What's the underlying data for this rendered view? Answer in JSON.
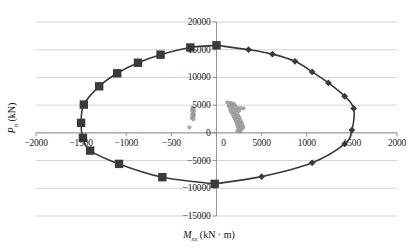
{
  "axes": {
    "x_title_main": "M",
    "x_title_sub": "xx",
    "x_title_units": " (kN · m)",
    "y_title_main": "P",
    "y_title_sub": "n",
    "y_title_units": " (kN)"
  },
  "chart_data": {
    "type": "scatter",
    "title": "",
    "xlabel": "M_xx (kN · m)",
    "ylabel": "P_n (kN)",
    "xlim": [
      -2000,
      2000
    ],
    "ylim": [
      -15000,
      20000
    ],
    "xticks": [
      -2000,
      -1500,
      -1000,
      -500,
      0,
      500,
      1000,
      1500,
      2000
    ],
    "xticklabels": [
      "−2000",
      "−1500",
      "−1000",
      "−500",
      "0",
      "5000",
      "1000",
      "1500",
      "2000"
    ],
    "yticks": [
      -15000,
      -10000,
      -5000,
      0,
      5000,
      10000,
      15000,
      20000
    ],
    "yticklabels": [
      "−15000",
      "−10000",
      "−5000",
      "0",
      "5000",
      "10000",
      "15000",
      "20000"
    ],
    "grid": "horizontal",
    "legend": "none",
    "series": [
      {
        "name": "interaction-curve-left",
        "marker": "square",
        "color": "#3a3a3a",
        "points": [
          [
            0,
            15800
          ],
          [
            -290,
            15400
          ],
          [
            -620,
            14100
          ],
          [
            -870,
            12650
          ],
          [
            -1100,
            10750
          ],
          [
            -1300,
            8400
          ],
          [
            -1470,
            5100
          ],
          [
            -1500,
            1800
          ],
          [
            -1480,
            -900
          ],
          [
            -1400,
            -3200
          ],
          [
            -1080,
            -5600
          ],
          [
            -600,
            -8000
          ],
          [
            -20,
            -9200
          ]
        ]
      },
      {
        "name": "interaction-curve-right",
        "marker": "diamond",
        "color": "#3a3a3a",
        "points": [
          [
            0,
            15800
          ],
          [
            355,
            15000
          ],
          [
            620,
            14200
          ],
          [
            870,
            12900
          ],
          [
            1060,
            11000
          ],
          [
            1240,
            9000
          ],
          [
            1420,
            6600
          ],
          [
            1520,
            4400
          ],
          [
            1500,
            500
          ],
          [
            1420,
            -2000
          ],
          [
            1060,
            -5400
          ],
          [
            500,
            -7900
          ],
          [
            -20,
            -9200
          ]
        ]
      },
      {
        "name": "demand-points",
        "marker": "circle",
        "color": "#9a9a9a",
        "points": [
          [
            -265,
            4550
          ],
          [
            -258,
            4300
          ],
          [
            -270,
            4100
          ],
          [
            -250,
            3950
          ],
          [
            -262,
            3750
          ],
          [
            -255,
            3500
          ],
          [
            -268,
            3300
          ],
          [
            -252,
            3100
          ],
          [
            -260,
            2900
          ],
          [
            -272,
            2700
          ],
          [
            -256,
            2450
          ],
          [
            -300,
            1000
          ],
          [
            120,
            5500
          ],
          [
            155,
            5400
          ],
          [
            185,
            5300
          ],
          [
            145,
            5200
          ],
          [
            175,
            5050
          ],
          [
            205,
            4950
          ],
          [
            135,
            4850
          ],
          [
            165,
            4700
          ],
          [
            195,
            4600
          ],
          [
            230,
            4500
          ],
          [
            265,
            4450
          ],
          [
            300,
            4400
          ],
          [
            150,
            4300
          ],
          [
            185,
            4200
          ],
          [
            215,
            4100
          ],
          [
            250,
            4000
          ],
          [
            160,
            3850
          ],
          [
            195,
            3700
          ],
          [
            225,
            3600
          ],
          [
            175,
            3450
          ],
          [
            205,
            3300
          ],
          [
            240,
            3150
          ],
          [
            190,
            3000
          ],
          [
            220,
            2850
          ],
          [
            255,
            2700
          ],
          [
            200,
            2550
          ],
          [
            235,
            2400
          ],
          [
            265,
            2250
          ],
          [
            215,
            2100
          ],
          [
            245,
            1950
          ],
          [
            280,
            1800
          ],
          [
            225,
            1650
          ],
          [
            255,
            1500
          ],
          [
            290,
            1350
          ],
          [
            235,
            1200
          ],
          [
            265,
            1050
          ],
          [
            295,
            900
          ],
          [
            245,
            750
          ],
          [
            275,
            600
          ],
          [
            250,
            420
          ],
          [
            230,
            300
          ],
          [
            262,
            180
          ]
        ]
      }
    ]
  }
}
